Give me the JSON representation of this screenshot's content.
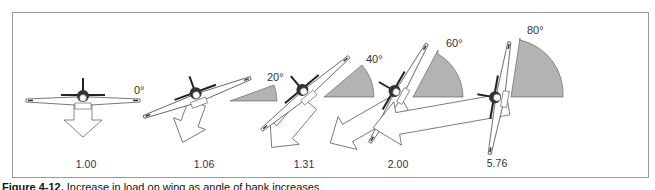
{
  "figure": {
    "caption_label": "Figure 4-12.",
    "caption_text": "Increase in load on wing as angle of bank increases.",
    "stages": [
      {
        "bank_angle": "0°",
        "load_factor": "1.00",
        "angle_deg": 0
      },
      {
        "bank_angle": "20°",
        "load_factor": "1.06",
        "angle_deg": 20
      },
      {
        "bank_angle": "40°",
        "load_factor": "1.31",
        "angle_deg": 40
      },
      {
        "bank_angle": "60°",
        "load_factor": "2.00",
        "angle_deg": 60
      },
      {
        "bank_angle": "80°",
        "load_factor": "5.76",
        "angle_deg": 80
      }
    ],
    "colors": {
      "border": "#9a9a9a",
      "wedge_fill": "#b3b3b3",
      "line": "#555555",
      "arrow_fill": "#ffffff"
    }
  }
}
